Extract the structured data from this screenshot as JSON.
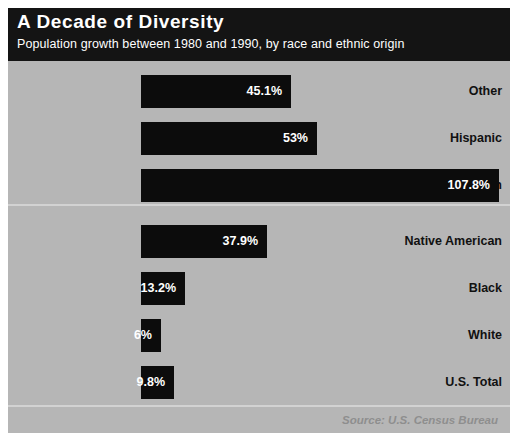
{
  "header": {
    "title": "A Decade of Diversity",
    "subtitle": "Population growth between 1980 and 1990, by race and ethnic origin"
  },
  "footer": {
    "source": "Source: U.S. Census Bureau"
  },
  "colors": {
    "header_background": "#141414",
    "plot_background": "#b6b6b6",
    "bar": "#0c0c0c",
    "bar_value_text": "#ffffff",
    "label_text": "#111111",
    "divider": "#d2d2d2",
    "source_text": "#8e8e8e",
    "page_background": "#ffffff"
  },
  "chart_data": {
    "type": "bar",
    "orientation": "horizontal",
    "title": "A Decade of Diversity",
    "subtitle": "Population growth between 1980 and 1990, by race and ethnic origin",
    "xlabel": "",
    "ylabel": "",
    "unit": "percent",
    "xlim": [
      0,
      107.8
    ],
    "grid": false,
    "legend": false,
    "source": "Source: U.S. Census Bureau",
    "categories": [
      "Other",
      "Hispanic",
      "Asian",
      "Native American",
      "Black",
      "White",
      "U.S. Total"
    ],
    "values": [
      45.1,
      53,
      107.8,
      37.9,
      13.2,
      6,
      9.8
    ],
    "value_labels": [
      "45.1%",
      "53%",
      "107.8%",
      "37.9%",
      "13.2%",
      "6%",
      "9.8%"
    ],
    "group_break_after_index": 2
  }
}
